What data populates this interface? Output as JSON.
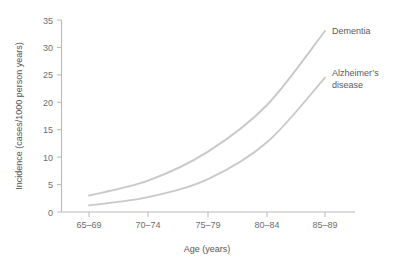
{
  "chart_data": {
    "type": "line",
    "title": "",
    "xlabel": "Age (years)",
    "ylabel": "Incidence (cases/1000 person years)",
    "categories": [
      "65–69",
      "70–74",
      "75–79",
      "80–84",
      "85–89"
    ],
    "x": [
      0,
      1,
      2,
      3,
      4
    ],
    "ylim": [
      0,
      35
    ],
    "yticks": [
      0,
      5,
      10,
      15,
      20,
      25,
      30,
      35
    ],
    "ytick_labels": [
      "0",
      "5",
      "10",
      "15",
      "20",
      "25",
      "30",
      "35"
    ],
    "grid": false,
    "legend_position": "right-inline-labels",
    "series": [
      {
        "name": "Dementia",
        "color": "#c9c9c9",
        "values": [
          3.0,
          5.7,
          11.0,
          19.5,
          33.0
        ]
      },
      {
        "name": "Alzheimer's disease",
        "color": "#c9c9c9",
        "values": [
          1.2,
          2.7,
          6.0,
          12.7,
          24.5
        ]
      }
    ],
    "annotations": [
      {
        "text": "Dementia",
        "series": "Dementia"
      },
      {
        "text": "Alzheimer's",
        "series": "Alzheimer's disease"
      },
      {
        "text": "disease",
        "series": "Alzheimer's disease"
      }
    ]
  },
  "axis": {
    "x_title": "Age (years)",
    "y_title": "Incidence (cases/1000 person years)"
  },
  "labels": {
    "dementia": "Dementia",
    "alzheimers_line1": "Alzheimer’s",
    "alzheimers_line2": "disease"
  },
  "colors": {
    "line": "#c9c9c9",
    "axis": "#b9b9b9",
    "text": "#6e6e6e",
    "background": "#ffffff"
  }
}
